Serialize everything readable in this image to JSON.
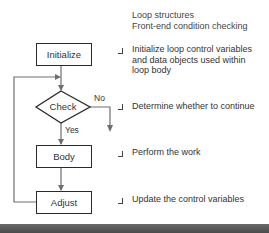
{
  "header": {
    "title_line1": "Loop structures",
    "title_line2": "Front-end condition checking"
  },
  "flowchart": {
    "nodes": [
      {
        "id": "initialize",
        "shape": "rectangle",
        "label": "Initialize"
      },
      {
        "id": "check",
        "shape": "diamond",
        "label": "Check"
      },
      {
        "id": "body",
        "shape": "rectangle",
        "label": "Body"
      },
      {
        "id": "adjust",
        "shape": "rectangle",
        "label": "Adjust"
      }
    ],
    "edge_labels": {
      "no": "No",
      "yes": "Yes"
    }
  },
  "notes": {
    "initialize_line1": "Initialize loop control variables",
    "initialize_line2": "and data objects used within",
    "initialize_line3": "loop body",
    "check": "Determine whether to continue",
    "body": "Perform the work",
    "adjust": "Update the control variables"
  },
  "colors": {
    "line": "#6e6e6e",
    "box_border": "#2a2a2a",
    "band": "#555555"
  }
}
